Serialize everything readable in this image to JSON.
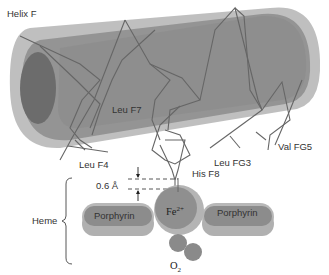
{
  "title": "Helix F",
  "labels": {
    "helix": "Helix F",
    "leu_f7": "Leu F7",
    "leu_f4": "Leu F4",
    "leu_fg3": "Leu FG3",
    "val_fg5": "Val FG5",
    "his_f8": "His F8",
    "distance": "0.6 Å",
    "heme": "Heme",
    "porphyrin_left": "Porphyrin",
    "porphyrin_right": "Porphyrin",
    "iron": "Fe",
    "iron_charge": "2+",
    "oxygen": "O",
    "oxygen_sub": "2"
  },
  "colors": {
    "helix_outer": "#a0a0a0",
    "helix_inner": "#8c8c8c",
    "helix_end": "#6e6e6e",
    "chain": "#666666",
    "porphyrin_light": "#b8b8b8",
    "porphyrin_dark": "#8a8a8a",
    "iron_outer": "#b0b0b0",
    "iron_inner": "#8f8f8f",
    "oxygen": "#8a8a8a"
  }
}
